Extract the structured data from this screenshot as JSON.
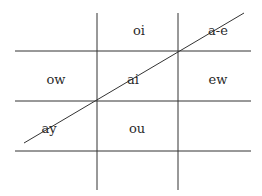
{
  "diagram": {
    "title": "",
    "cells": [
      {
        "row": 0,
        "col": 1,
        "text": "oi"
      },
      {
        "row": 0,
        "col": 2,
        "text": "a-e"
      },
      {
        "row": 1,
        "col": 0,
        "text": "ow"
      },
      {
        "row": 1,
        "col": 1,
        "text": "ai"
      },
      {
        "row": 1,
        "col": 2,
        "text": "ew"
      },
      {
        "row": 2,
        "col": 0,
        "text": "ay"
      },
      {
        "row": 2,
        "col": 1,
        "text": "ou"
      }
    ],
    "diagonal_line": {
      "description": "line through cells containing a-e, ai, ay"
    }
  }
}
